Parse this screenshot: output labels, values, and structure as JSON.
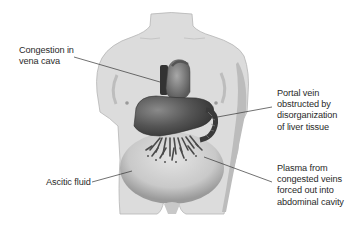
{
  "diagram": {
    "colors": {
      "body_fill": "#dcdcdc",
      "body_shadow": "#bdbdbd",
      "organ_dark": "#4a4a4a",
      "organ_mid": "#6e6e6e",
      "heart": "#8a8a8a",
      "line": "#333333",
      "text": "#2a2a2a"
    },
    "labels": [
      {
        "id": "vena-cava",
        "lines": [
          "Congestion in",
          "vena cava"
        ]
      },
      {
        "id": "portal-vein",
        "lines": [
          "Portal vein",
          "obstructed by",
          "disorganization",
          "of liver tissue"
        ]
      },
      {
        "id": "plasma",
        "lines": [
          "Plasma from",
          "congested veins",
          "forced out into",
          "abdominal cavity"
        ]
      },
      {
        "id": "ascitic-fluid",
        "lines": [
          "Ascitic fluid"
        ]
      }
    ]
  }
}
